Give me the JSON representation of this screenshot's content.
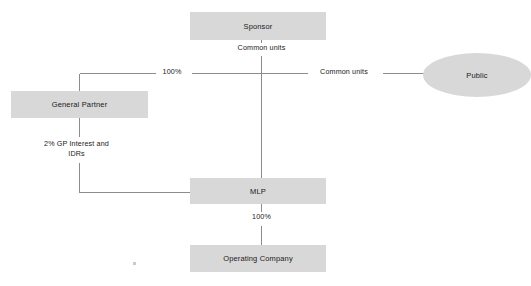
{
  "diagram": {
    "type": "organizational-structure",
    "style": {
      "node_fill": "#d8d8d8",
      "node_text": "#1a1a1a",
      "line_color": "#8c8c8c",
      "background": "#ffffff"
    },
    "nodes": [
      {
        "id": "sponsor",
        "label": "Sponsor",
        "shape": "rect",
        "x": 190,
        "y": 12,
        "w": 136,
        "h": 28
      },
      {
        "id": "general-partner",
        "label": "General Partner",
        "shape": "rect",
        "x": 11,
        "y": 91,
        "w": 137,
        "h": 27
      },
      {
        "id": "mlp",
        "label": "MLP",
        "shape": "rect",
        "x": 190,
        "y": 178,
        "w": 136,
        "h": 26
      },
      {
        "id": "operating-company",
        "label": "Operating Company",
        "shape": "rect",
        "x": 190,
        "y": 245,
        "w": 136,
        "h": 27
      },
      {
        "id": "public",
        "label": "Public",
        "shape": "ellipse",
        "x": 423,
        "y": 53,
        "w": 108,
        "h": 44
      }
    ],
    "edges": [
      {
        "id": "sponsor-to-mlp",
        "from": "sponsor",
        "to": "mlp",
        "label": "Common units",
        "label_x": 261,
        "label_y": 46
      },
      {
        "id": "sponsor-to-general-partner",
        "from": "sponsor",
        "to": "general-partner",
        "label": "100%",
        "label_x": 171,
        "label_y": 67
      },
      {
        "id": "public-to-mlp",
        "from": "public",
        "to": "mlp",
        "label": "Common units",
        "label_x": 342,
        "label_y": 67
      },
      {
        "id": "general-partner-to-mlp",
        "from": "general-partner",
        "to": "mlp",
        "label": "2% GP Interest and\nIDRs",
        "label_x": 76,
        "label_y": 144
      },
      {
        "id": "mlp-to-operating-company",
        "from": "mlp",
        "to": "operating-company",
        "label": "100%",
        "label_x": 261,
        "label_y": 214
      }
    ]
  }
}
